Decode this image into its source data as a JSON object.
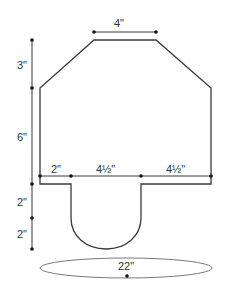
{
  "diagram": {
    "type": "sewing-pattern",
    "stroke_color": "#3a3a3a",
    "ellipse_stroke_color": "#7a7a7a",
    "dimensions": {
      "top_width": "4\"",
      "upper_height": "3\"",
      "body_height": "6\"",
      "tab_offset": "2\"",
      "tab_width": "4½\"",
      "right_width": "4½\"",
      "tab_straight_height": "2\"",
      "tab_round_height": "2\"",
      "base_circumference": "22\""
    }
  }
}
